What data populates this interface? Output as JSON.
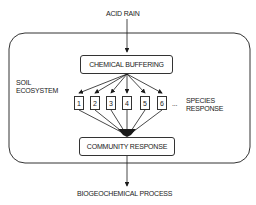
{
  "diagram": {
    "input_label": "ACID RAIN",
    "output_label": "BIOGEOCHEMICAL PROCESS",
    "container_label_line1": "SOIL",
    "container_label_line2": "ECOSYSTEM",
    "buffer_box": "CHEMICAL BUFFERING",
    "community_box": "COMMUNITY RESPONSE",
    "species_ellipsis": "...",
    "species_label_line1": "SPECIES",
    "species_label_line2": "RESPONSE",
    "species": [
      "1",
      "2",
      "3",
      "4",
      "5",
      "6"
    ]
  }
}
